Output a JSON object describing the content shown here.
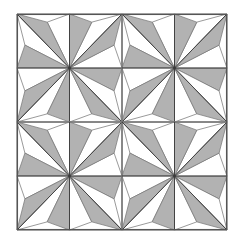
{
  "figure": {
    "kind": "geometric-pattern",
    "width": 240,
    "height": 243,
    "background_color": "#ffffff"
  },
  "colors": {
    "fill_gray": "#b2b2b2",
    "fill_white": "#ffffff",
    "outline_dark": "#3a3a3a",
    "outline_mid": "#787878",
    "border": "#555555"
  },
  "layout": {
    "frame": {
      "x": 17,
      "y": 14,
      "width": 210,
      "height": 216
    },
    "grid_rows": 2,
    "grid_cols": 2,
    "block_width": 105,
    "block_height": 108,
    "block_count": 4
  },
  "block": {
    "name": "eight-pointed-star",
    "points": 8,
    "point_shape": "diamond-split-in-half",
    "gray_halves_per_star": 8,
    "white_halves_per_star": 8,
    "corner_triangles": 4,
    "edge_triangles": 4,
    "rotation_symmetry": "90deg",
    "repeat_mode": "translation"
  },
  "blocks": [
    {
      "id": "block-top-left",
      "row": 0,
      "col": 0,
      "cx": 69.5,
      "cy": 68.0
    },
    {
      "id": "block-top-right",
      "row": 0,
      "col": 1,
      "cx": 174.5,
      "cy": 68.0
    },
    {
      "id": "block-bottom-left",
      "row": 1,
      "col": 0,
      "cx": 69.5,
      "cy": 176.0
    },
    {
      "id": "block-bottom-right",
      "row": 1,
      "col": 1,
      "cx": 174.5,
      "cy": 176.0
    }
  ],
  "stroke": {
    "outer_border_width": 1.1,
    "seam_width": 0.9,
    "detail_width": 0.75
  }
}
